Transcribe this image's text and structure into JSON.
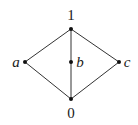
{
  "diagram": {
    "type": "hasse-diagram",
    "colors": {
      "edge": "#333333",
      "node": "#111111",
      "label": "#1a1a1a",
      "background": "#ffffff"
    },
    "nodes": [
      {
        "id": "top",
        "label": "1",
        "x": 71,
        "y": 29,
        "lx": 71,
        "ly": 20,
        "anchor": "middle",
        "italic": false
      },
      {
        "id": "a",
        "label": "a",
        "x": 25,
        "y": 62,
        "lx": 16,
        "ly": 67,
        "anchor": "middle",
        "italic": true
      },
      {
        "id": "b",
        "label": "b",
        "x": 71,
        "y": 62,
        "lx": 80,
        "ly": 67,
        "anchor": "middle",
        "italic": true
      },
      {
        "id": "c",
        "label": "c",
        "x": 119,
        "y": 62,
        "lx": 127,
        "ly": 67,
        "anchor": "middle",
        "italic": true
      },
      {
        "id": "bottom",
        "label": "0",
        "x": 71,
        "y": 99,
        "lx": 71,
        "ly": 118,
        "anchor": "middle",
        "italic": false
      }
    ],
    "edges": [
      {
        "from": "top",
        "to": "a"
      },
      {
        "from": "top",
        "to": "b"
      },
      {
        "from": "top",
        "to": "c"
      },
      {
        "from": "a",
        "to": "bottom"
      },
      {
        "from": "b",
        "to": "bottom"
      },
      {
        "from": "c",
        "to": "bottom"
      }
    ]
  }
}
